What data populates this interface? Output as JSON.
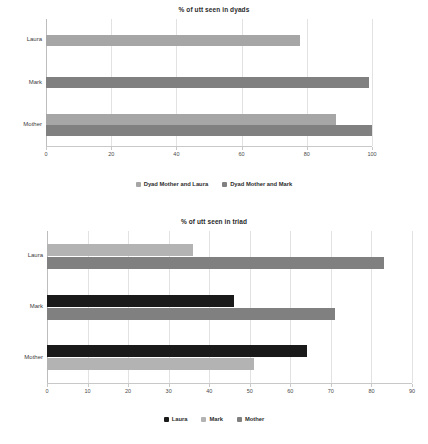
{
  "chart_data": [
    {
      "type": "bar",
      "orientation": "horizontal",
      "title": "% of utt seen in dyads",
      "xlabel": "",
      "ylabel": "",
      "categories": [
        "Laura",
        "Mark",
        "Mother"
      ],
      "ticks": [
        0,
        20,
        40,
        60,
        80,
        100
      ],
      "xlim": [
        0,
        100
      ],
      "grid": true,
      "legend_position": "bottom",
      "series": [
        {
          "name": "Dyad Mother and Laura",
          "color": "#a6a6a6",
          "values": [
            78,
            0,
            89
          ]
        },
        {
          "name": "Dyad Mother and Mark",
          "color": "#808080",
          "values": [
            0,
            99,
            100
          ]
        }
      ]
    },
    {
      "type": "bar",
      "orientation": "horizontal",
      "title": "% of utt seen in triad",
      "xlabel": "",
      "ylabel": "",
      "categories": [
        "Laura",
        "Mark",
        "Mother"
      ],
      "ticks": [
        0,
        10,
        20,
        30,
        40,
        50,
        60,
        70,
        80,
        90
      ],
      "xlim": [
        0,
        90
      ],
      "grid": true,
      "legend_position": "bottom",
      "series": [
        {
          "name": "Laura",
          "color": "#1a1a1a",
          "values": [
            0,
            46,
            64
          ]
        },
        {
          "name": "Mark",
          "color": "#b3b3b3",
          "values": [
            36,
            0,
            51
          ]
        },
        {
          "name": "Mother",
          "color": "#808080",
          "values": [
            83,
            71,
            0
          ]
        }
      ]
    }
  ]
}
